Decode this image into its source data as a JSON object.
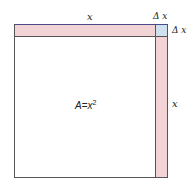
{
  "diagram": {
    "title": "",
    "labels": {
      "top_x": "x",
      "top_delta_x": "Δ x",
      "right_delta_x": "Δ x",
      "right_x": "x",
      "area_A": "A",
      "area_eq": "=",
      "area_x": "x",
      "area_exp": "2"
    },
    "colors": {
      "strip": "#f2d4d7",
      "corner": "#cfe0ee",
      "border": "#555555",
      "top_border": "#4a4a8a"
    }
  }
}
